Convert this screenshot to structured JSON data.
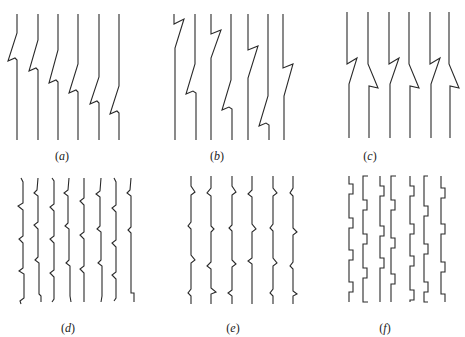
{
  "figure": {
    "panels": [
      {
        "id": "a",
        "label": "(a)",
        "label_x": 62,
        "label_y": 160,
        "description": "Six vertical lines, each with a single Z-shaped kink; kinks step progressively lower from left to right",
        "paths": [
          "M17,14 L17,33 L8,61 L15,58 L17,60 L17,140",
          "M38,14 L38,40 L29,71 L36,68 L38,70 L38,140",
          "M58,14 L58,50 L49,83 L56,80 L58,82 L58,140",
          "M78,14 L78,64 L69,93 L76,90 L78,92 L78,140",
          "M99,14 L99,77 L90,104 L97,101 L99,103 L99,140",
          "M119,14 L119,86 L110,114 L117,111 L119,113 L119,140"
        ]
      },
      {
        "id": "b",
        "label": "(b)",
        "label_x": 217,
        "label_y": 160,
        "description": "Six vertical lines with single kinks at irregular heights",
        "paths": [
          "M174,14 L174,24 L184,19 L175,48 L175,140",
          "M195,14 L195,64 L186,94 L193,91 L196,93 L196,140",
          "M211,14 L211,34 L221,30 L211,58 L211,140",
          "M231,14 L231,80 L222,110 L229,107 L232,109 L232,140",
          "M248,14 L248,50 L258,46 L248,78 L248,140",
          "M268,14 L268,96 L259,126 L266,123 L269,125 L269,140",
          "M283,14 L283,68 L293,64 L284,96 L284,140"
        ]
      },
      {
        "id": "c",
        "label": "(c)",
        "label_x": 370,
        "label_y": 160,
        "description": "Six vertical lines with paired, mirror-image kinks at the same height",
        "paths": [
          "M347,12 L347,64 L357,58 L349,84 L349,138",
          "M368,12 L368,64 L378,88 L369,86 L369,138",
          "M389,12 L389,64 L399,58 L390,84 L390,138",
          "M409,12 L409,64 L419,88 L410,86 L410,138",
          "M430,12 L430,64 L440,58 L431,84 L431,138",
          "M449,12 L449,64 L459,88 L450,86 L450,138"
        ]
      },
      {
        "id": "d",
        "label": "(d)",
        "label_x": 68,
        "label_y": 332,
        "description": "Eight vertical lines each with many small irregular kinks along their length",
        "paths": [
          "M21,178 L23,182 L23,203 L18,206 L23,210 L23,236 L19,239 L23,243 L23,268 L19,271 L24,274 L24,298 L20,301 L21,304",
          "M38,178 L37,190 L34,193 L38,196 L38,222 L34,225 L38,229 L38,257 L35,260 L39,263 L39,294 L41,296 L41,302",
          "M52,178 L54,181 L54,204 L50,207 L54,211 L54,236 L50,239 L54,243 L54,270 L50,273 L54,277 L54,299 L52,302",
          "M69,178 L68,190 L64,193 L68,196 L68,223 L65,226 L69,229 L69,260 L66,263 L70,266 L70,296 L71,302",
          "M84,178 L84,198 L80,201 L84,205 L84,232 L80,235 L84,239 L84,266 L80,269 L84,273 L84,297 L84,302",
          "M101,178 L100,191 L96,194 L100,197 L100,226 L97,229 L101,232 L101,260 L98,263 L102,266 L102,296 L101,302",
          "M114,178 L116,182 L116,205 L112,208 L116,212 L116,240 L112,243 L116,247 L116,272 L112,275 L116,279 L116,298 L114,301",
          "M131,178 L130,190 L127,193 L131,196 L131,227 L128,230 L131,233 L131,262 L131,293 L134,293 L134,302"
        ]
      },
      {
        "id": "e",
        "label": "(e)",
        "label_x": 233,
        "label_y": 332,
        "description": "Six vertical lines with symmetric bulge-shaped kinks at regular intervals",
        "paths": [
          "M191,176 L191,186 L195,192 L191,195 L191,222 L188,226 L191,229 L191,255 L195,260 L191,263 L191,289 L188,293 L191,296 L191,304",
          "M211,176 L211,188 L207,193 L211,196 L211,226 L214,229 L211,232 L211,262 L207,266 L211,269 L211,288 L216,292 L211,294 L211,304",
          "M232,176 L232,186 L236,192 L232,195 L232,225 L229,228 L232,231 L232,260 L236,264 L232,267 L232,290 L228,293 L232,296 L232,304",
          "M252,176 L252,190 L248,194 L252,197 L252,224 L256,229 L252,232 L252,258 L248,261 L252,264 L252,293 L252,304",
          "M273,176 L273,188 L277,193 L273,196 L273,224 L270,228 L273,231 L273,258 L277,263 L273,266 L273,289 L270,293 L273,296 L273,304",
          "M293,176 L293,188 L290,193 L293,196 L293,228 L297,232 L293,235 L293,262 L290,266 L293,269 L293,291 L297,294 L293,296 L293,304"
        ]
      },
      {
        "id": "f",
        "label": "(f)",
        "label_x": 385,
        "label_y": 332,
        "description": "Seven vertical lines with rectangular step-shaped kinks at regular intervals",
        "paths": [
          "M349,176 L349,184 L353,184 L353,194 L349,194 L349,218 L353,218 L353,228 L349,228 L349,250 L353,250 L353,260 L349,260 L349,282 L353,282 L353,292 L349,292 L349,302",
          "M368,176 L363,176 L363,200 L367,200 L367,210 L363,210 L363,234 L367,234 L367,244 L363,244 L363,268 L367,268 L367,278 L363,278 L363,302 L368,302",
          "M380,176 L380,186 L384,186 L384,196 L380,196 L380,226 L384,226 L384,236 L380,236 L380,258 L384,258 L384,268 L380,268 L380,302",
          "M396,176 L391,176 L391,200 L395,200 L395,210 L391,210 L391,238 L395,238 L395,248 L391,248 L391,274 L395,274 L395,284 L391,284 L391,302",
          "M410,176 L410,186 L414,186 L414,196 L410,196 L410,224 L414,224 L414,234 L410,234 L410,256 L414,256 L414,266 L410,266 L410,290 L414,290 L414,300 L410,300 L410,302",
          "M428,176 L424,176 L424,206 L428,206 L428,216 L424,216 L424,244 L428,244 L428,254 L424,254 L424,282 L428,282 L428,292 L424,292 L424,302 L428,302",
          "M441,176 L441,188 L445,188 L445,198 L441,198 L441,224 L445,224 L445,234 L441,234 L441,262 L445,262 L445,272 L441,272 L441,294 L445,294 L445,302"
        ]
      }
    ]
  }
}
